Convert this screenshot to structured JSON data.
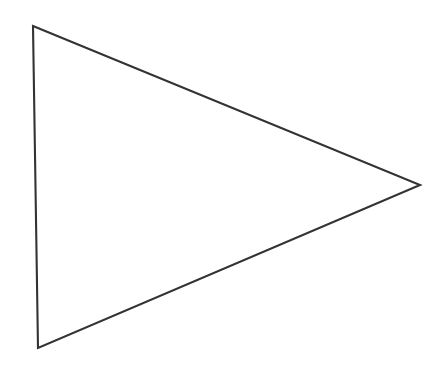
{
  "canvas": {
    "width": 446,
    "height": 374,
    "background_color": "#ffffff"
  },
  "figure": {
    "name": "triangle-outline",
    "shape_type": "triangle",
    "filled": false,
    "fill_color": "none",
    "stroke_color": "#333333",
    "stroke_width": 2.1,
    "stroke_opacity": 1,
    "vertices": [
      {
        "label": "top-left",
        "x": 33,
        "y": 26
      },
      {
        "label": "right",
        "x": 420,
        "y": 185
      },
      {
        "label": "bottom-left",
        "x": 38,
        "y": 348
      }
    ],
    "points_attr": "33,26 420,185 38,348",
    "edges": [
      {
        "name": "top-edge",
        "from": "top-left",
        "to": "right"
      },
      {
        "name": "bottom-edge",
        "from": "right",
        "to": "bottom-left"
      },
      {
        "name": "left-edge",
        "from": "bottom-left",
        "to": "top-left"
      }
    ]
  }
}
